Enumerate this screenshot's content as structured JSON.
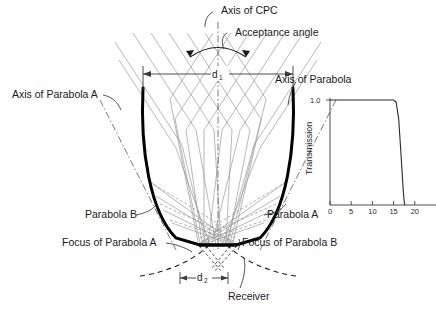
{
  "figure": {
    "type": "cpc-concentrator-diagram",
    "title_labels": {
      "axis_of_cpc": "Axis of CPC",
      "acceptance_angle": "Acceptance angle",
      "axis_of_parabola_a": "Axis of Parabola A",
      "axis_of_parabola_b": "Axis of Parabola",
      "parabola_b": "Parabola B",
      "parabola_a": "Parabola A",
      "focus_of_parabola_a": "Focus of Parabola A",
      "focus_of_parabola_b": "Focus of Parabola B",
      "receiver": "Receiver"
    },
    "dimensions": {
      "aperture_symbol": "d",
      "aperture_subscript": "1",
      "receiver_symbol": "d",
      "receiver_subscript": "2"
    }
  },
  "chart_data": {
    "type": "line",
    "title": "",
    "xlabel": "",
    "ylabel": "Transmission",
    "x": [
      0,
      2,
      4,
      6,
      8,
      10,
      12,
      14,
      15,
      15.6,
      16.2,
      16.8,
      17.3,
      17.6
    ],
    "values": [
      1.0,
      1.0,
      1.0,
      1.0,
      1.0,
      1.0,
      1.0,
      1.0,
      1.0,
      0.98,
      0.82,
      0.45,
      0.12,
      0.0
    ],
    "xticks": [
      0,
      5,
      10,
      15,
      20
    ],
    "xticklabels": [
      "0",
      "5",
      "10",
      "15",
      "20"
    ],
    "yticks": [
      1.0
    ],
    "yticklabels": [
      "1.0"
    ],
    "xlim": [
      0,
      25
    ],
    "ylim": [
      0,
      1.08
    ],
    "grid": false,
    "legend": false,
    "series_name": "Transmission"
  }
}
